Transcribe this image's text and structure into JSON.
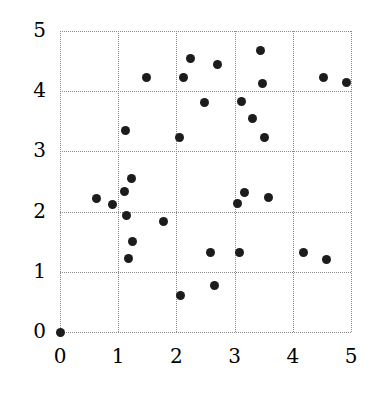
{
  "chart_data": {
    "type": "scatter",
    "title": "",
    "xlabel": "",
    "ylabel": "",
    "xlim": [
      0,
      5
    ],
    "ylim": [
      0,
      5
    ],
    "xticks": [
      0,
      1,
      2,
      3,
      4,
      5
    ],
    "yticks": [
      0,
      1,
      2,
      3,
      4,
      5
    ],
    "xtick_labels": [
      "0",
      "1",
      "2",
      "3",
      "4",
      "5"
    ],
    "ytick_labels": [
      "0",
      "1",
      "2",
      "3",
      "4",
      "5"
    ],
    "grid": true,
    "grid_style": "dotted",
    "legend": null,
    "marker": "filled-circle",
    "marker_color": "#1c1c1c",
    "marker_size": 9,
    "grid_color": "#8a8a8a",
    "background_color": "#ffffff",
    "points": [
      {
        "x": 0.0,
        "y": 0.0
      },
      {
        "x": 0.62,
        "y": 2.22
      },
      {
        "x": 0.9,
        "y": 2.12
      },
      {
        "x": 1.1,
        "y": 2.33
      },
      {
        "x": 1.12,
        "y": 3.35
      },
      {
        "x": 1.15,
        "y": 1.93
      },
      {
        "x": 1.18,
        "y": 1.22
      },
      {
        "x": 1.22,
        "y": 2.55
      },
      {
        "x": 1.25,
        "y": 1.5
      },
      {
        "x": 1.48,
        "y": 4.22
      },
      {
        "x": 1.78,
        "y": 1.83
      },
      {
        "x": 2.05,
        "y": 3.23
      },
      {
        "x": 2.07,
        "y": 0.6
      },
      {
        "x": 2.13,
        "y": 4.23
      },
      {
        "x": 2.25,
        "y": 4.55
      },
      {
        "x": 2.48,
        "y": 3.82
      },
      {
        "x": 2.58,
        "y": 1.32
      },
      {
        "x": 2.65,
        "y": 0.78
      },
      {
        "x": 2.7,
        "y": 4.45
      },
      {
        "x": 3.05,
        "y": 2.13
      },
      {
        "x": 3.08,
        "y": 1.32
      },
      {
        "x": 3.12,
        "y": 3.83
      },
      {
        "x": 3.17,
        "y": 2.32
      },
      {
        "x": 3.3,
        "y": 3.55
      },
      {
        "x": 3.45,
        "y": 4.68
      },
      {
        "x": 3.48,
        "y": 4.13
      },
      {
        "x": 3.52,
        "y": 3.23
      },
      {
        "x": 3.58,
        "y": 2.23
      },
      {
        "x": 4.18,
        "y": 1.32
      },
      {
        "x": 4.52,
        "y": 4.22
      },
      {
        "x": 4.58,
        "y": 1.2
      },
      {
        "x": 4.92,
        "y": 4.15
      }
    ]
  }
}
